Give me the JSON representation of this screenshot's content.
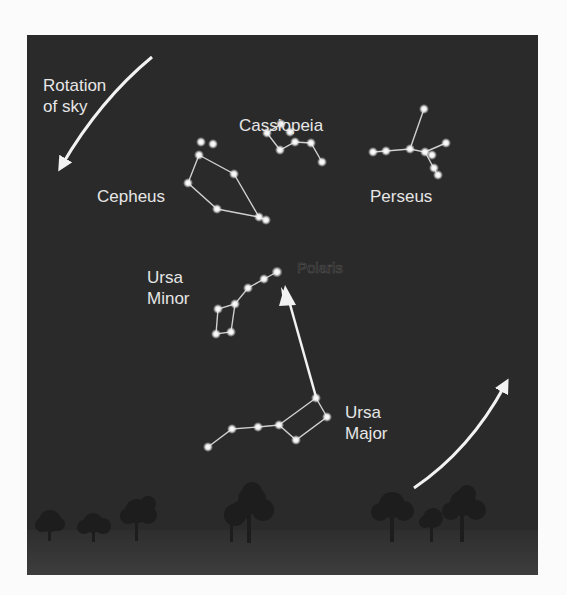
{
  "figure": {
    "rotation_label": "Rotation\nof sky",
    "rotation_label_lines": [
      "Rotation",
      "of sky"
    ],
    "polaris_label": "Polaris",
    "constellations": [
      {
        "name": "Cassiopeia",
        "label_lines": [
          "Cassiopeia"
        ]
      },
      {
        "name": "Cepheus",
        "label_lines": [
          "Cepheus"
        ]
      },
      {
        "name": "Perseus",
        "label_lines": [
          "Perseus"
        ]
      },
      {
        "name": "Ursa Minor",
        "label_lines": [
          "Ursa",
          "Minor"
        ]
      },
      {
        "name": "Ursa Major",
        "label_lines": [
          "Ursa",
          "Major"
        ]
      }
    ],
    "colors": {
      "sky": "#2a2a2a",
      "ground": "#3a3a3a",
      "stars": "#f0f0f0",
      "lines": "#cfcfcf",
      "text": "#e6e6e6"
    }
  }
}
